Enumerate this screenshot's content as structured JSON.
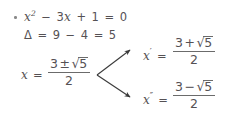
{
  "document": {
    "kind": "handwritten-math-notes",
    "background_color": "#ffffff",
    "ink_color": "#555154",
    "topic": "Quadratic equation solved with the quadratic formula"
  },
  "bullet": {
    "glyph": "bullet-point",
    "color": "#8a8a8a"
  },
  "equation_line": {
    "name": "quadratic-equation",
    "variable": "x",
    "exponent": "2",
    "minus": "−",
    "coefficient_term": "3",
    "plus": "+",
    "constant": "1",
    "equals": "=",
    "rhs": "0",
    "full_text": "x² − 3x + 1 = 0"
  },
  "discriminant_line": {
    "name": "discriminant",
    "symbol": "Δ",
    "equals": "=",
    "first_value": "9",
    "minus": "−",
    "second_value": "4",
    "equals2": "=",
    "result": "5",
    "full_text": "Δ = 9 − 4 = 5"
  },
  "main_solution": {
    "name": "combined-root",
    "variable": "x",
    "equals": "=",
    "numerator_lead": "3",
    "plus_minus": "±",
    "radical_sign": "√",
    "radicand": "5",
    "denominator": "2",
    "full_text": "x = (3 ± √5) / 2"
  },
  "branches": [
    {
      "name": "first-root",
      "variable": "x",
      "prime": "′",
      "equals": "=",
      "numerator_lead": "3",
      "operator": "+",
      "radical_sign": "√",
      "radicand": "5",
      "denominator": "2",
      "full_text": "x′ = (3 + √5) / 2"
    },
    {
      "name": "second-root",
      "variable": "x",
      "prime": "″",
      "equals": "=",
      "numerator_lead": "3",
      "operator": "−",
      "radical_sign": "√",
      "radicand": "5",
      "denominator": "2",
      "full_text": "x″ = (3 − √5) / 2"
    }
  ],
  "arrows": {
    "name": "branch-arrows",
    "color": "#3a3a3a",
    "count": 2,
    "origin": "combined-root",
    "targets": [
      "first-root",
      "second-root"
    ]
  }
}
